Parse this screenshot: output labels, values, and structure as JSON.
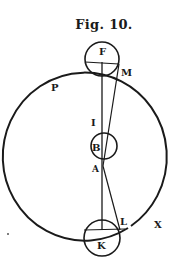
{
  "figure": {
    "title": "Fig. 10.",
    "ink_color": "#1a1a1a",
    "background": "#ffffff"
  },
  "labels": {
    "F": "F",
    "M": "M",
    "P": "P",
    "I": "I",
    "B": "B",
    "A": "A",
    "K": "K",
    "L": "L",
    "X": "X"
  },
  "elements": {
    "orbit_circle": {
      "cx": 101,
      "cy": 147,
      "rx": 82,
      "ry": 84
    },
    "circle_F": {
      "cx": 102,
      "cy": 59,
      "r": 17
    },
    "circle_B": {
      "cx": 104,
      "cy": 146,
      "r": 13
    },
    "circle_K": {
      "cx": 102,
      "cy": 238,
      "r": 18
    }
  }
}
